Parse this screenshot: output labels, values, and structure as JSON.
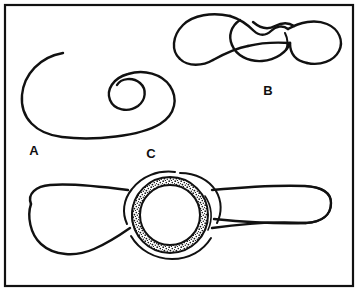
{
  "figure": {
    "background_color": "#ffffff",
    "ink_color": "#111111",
    "frame": {
      "present": true,
      "x": 5,
      "y": 5,
      "width": 348,
      "height": 281,
      "stroke_width": 2.2
    },
    "panels": [
      {
        "id": "A",
        "label": "A",
        "label_x": 34,
        "label_y": 155,
        "description": "Large flattened oval outline whose contour spirals inward to form a smaller inner loop, drawn as a single continuous open line.",
        "shape_type": "spiral-oval"
      },
      {
        "id": "B",
        "label": "B",
        "label_x": 268,
        "label_y": 95,
        "description": "Elongated bilobed tube with a narrowed twisted crossing region near the middle; left lobe rounded, right lobe rounded, overlapping contours at the constriction.",
        "shape_type": "twisted-tube"
      },
      {
        "id": "C",
        "label": "C",
        "label_x": 151,
        "label_y": 158,
        "description": "Long horizontal tube with a bulbous left end and rounded right end, interrupted mid-length by a circular ring with a stippled granular annulus and surrounding cupped arcs.",
        "shape_type": "tube-with-stippled-ring"
      }
    ],
    "ring": {
      "center_x": 170,
      "center_y": 215,
      "outer_radius": 40,
      "annulus_outer_radius": 38,
      "annulus_inner_radius": 30,
      "texture": "stippled"
    }
  }
}
